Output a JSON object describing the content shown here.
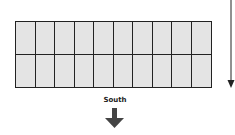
{
  "diagram": {
    "type": "panel-array-layout",
    "rows": 2,
    "columns": 10,
    "direction_label": "South",
    "colors": {
      "panel_fill": "#e4e4e4",
      "stroke": "#222222"
    }
  }
}
